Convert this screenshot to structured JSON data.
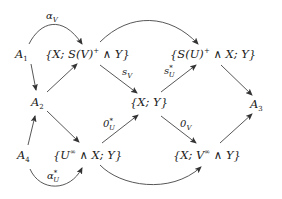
{
  "diagram": {
    "type": "commutative-diagram",
    "nodes": {
      "A1": {
        "label": "A",
        "sub": "1"
      },
      "A2": {
        "label": "A",
        "sub": "2"
      },
      "A3": {
        "label": "A",
        "sub": "3"
      },
      "A4": {
        "label": "A",
        "sub": "4"
      },
      "XSVY": {
        "pre": "{X; S(V)",
        "sup": "+",
        "post": " ∧ Y}"
      },
      "SUXY": {
        "pre": "{S(U)",
        "sup": "+",
        "post": " ∧ X; Y}"
      },
      "XY": {
        "text": "{X; Y}"
      },
      "UXY": {
        "pre": "{U",
        "sup": "∞",
        "post": " ∧ X; Y}"
      },
      "XVY": {
        "pre": "{X; V",
        "sup": "∞",
        "post": " ∧ Y}"
      }
    },
    "edge_labels": {
      "alpha_V": {
        "base": "α",
        "sub": "V"
      },
      "s_V": {
        "base": "s",
        "sub": "V"
      },
      "s_U_star": {
        "base": "s",
        "sup": "*",
        "sub": "U"
      },
      "zero_U_star": {
        "base": "0",
        "sup": "*",
        "sub": "U"
      },
      "zero_V": {
        "base": "0",
        "sub": "V"
      },
      "alpha_U_star": {
        "base": "α",
        "sup": "*",
        "sub": "U"
      }
    },
    "edges": [
      {
        "from": "A1",
        "to": "XSVY",
        "label": "alpha_V",
        "curved": true
      },
      {
        "from": "A1",
        "to": "A2"
      },
      {
        "from": "A2",
        "to": "XSVY"
      },
      {
        "from": "A2",
        "to": "UXY"
      },
      {
        "from": "A4",
        "to": "A2"
      },
      {
        "from": "A4",
        "to": "UXY",
        "label": "alpha_U_star",
        "curved": true
      },
      {
        "from": "XSVY",
        "to": "XY",
        "label": "s_V"
      },
      {
        "from": "XSVY",
        "to": "SUXY",
        "curved": true
      },
      {
        "from": "UXY",
        "to": "XY",
        "label": "zero_U_star"
      },
      {
        "from": "UXY",
        "to": "XVY",
        "curved": true
      },
      {
        "from": "XY",
        "to": "SUXY",
        "label": "s_U_star"
      },
      {
        "from": "XY",
        "to": "XVY",
        "label": "zero_V"
      },
      {
        "from": "SUXY",
        "to": "A3"
      },
      {
        "from": "XVY",
        "to": "A3"
      }
    ]
  }
}
